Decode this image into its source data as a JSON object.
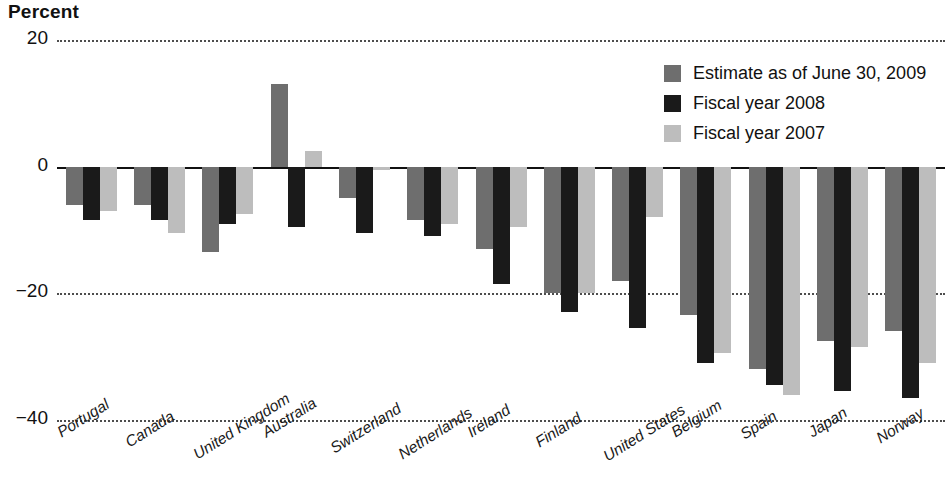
{
  "chart_data": {
    "type": "bar",
    "title": "Percent",
    "xlabel": "",
    "ylabel": "Percent",
    "ylim": [
      -40,
      20
    ],
    "yticks": [
      20,
      0,
      -20,
      -40
    ],
    "ytick_labels": [
      "20",
      "0",
      "−20",
      "−40"
    ],
    "grid": true,
    "legend_position": "top-right",
    "categories": [
      "Portugal",
      "Canada",
      "United Kingdom",
      "Australia",
      "Switzerland",
      "Netherlands",
      "Ireland",
      "Finland",
      "United States",
      "Belgium",
      "Spain",
      "Japan",
      "Norway"
    ],
    "series": [
      {
        "name": "Estimate as of June 30, 2009",
        "color": "#6e6e6e",
        "values": [
          -6.0,
          -6.0,
          -13.5,
          13.0,
          -5.0,
          -8.5,
          -13.0,
          -20.0,
          -18.0,
          -23.5,
          -32.0,
          -27.5,
          -26.0
        ]
      },
      {
        "name": "Fiscal year 2008",
        "color": "#1a1a1a",
        "values": [
          -8.5,
          -8.5,
          -9.0,
          -9.5,
          -10.5,
          -11.0,
          -18.5,
          -23.0,
          -25.5,
          -31.0,
          -34.5,
          -35.5,
          -36.5
        ]
      },
      {
        "name": "Fiscal year 2007",
        "color": "#bdbdbd",
        "values": [
          -7.0,
          -10.5,
          -7.5,
          2.5,
          -0.5,
          -9.0,
          -9.5,
          -20.0,
          -8.0,
          -29.5,
          -36.0,
          -28.5,
          -31.0
        ]
      }
    ]
  },
  "axis": {
    "y_title": "Percent"
  },
  "legend": {
    "items": [
      {
        "label": "Estimate as of June 30, 2009",
        "color": "#6e6e6e"
      },
      {
        "label": "Fiscal year 2008",
        "color": "#1a1a1a"
      },
      {
        "label": "Fiscal year 2007",
        "color": "#bdbdbd"
      }
    ]
  }
}
